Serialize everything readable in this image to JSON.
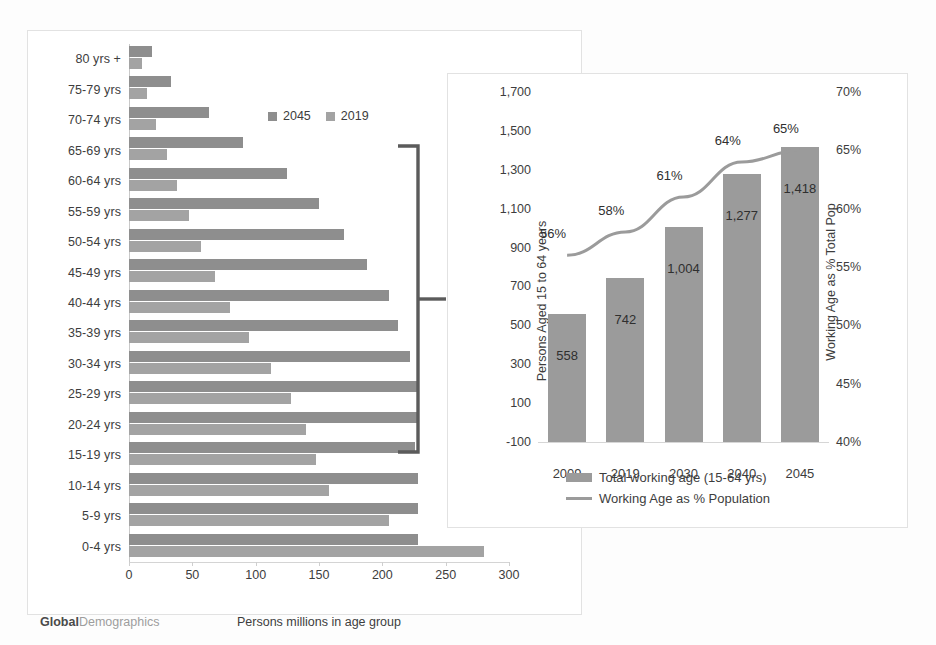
{
  "watermark": {
    "bold": "Global",
    "light": "Demographics"
  },
  "left_chart": {
    "x_axis_title": "Persons millions in age group",
    "x_ticks": [
      "0",
      "50",
      "100",
      "150",
      "200",
      "250",
      "300"
    ],
    "legend": [
      {
        "label": "2045",
        "color": "#8e8e8e"
      },
      {
        "label": "2019",
        "color": "#a3a3a3"
      }
    ]
  },
  "right_chart": {
    "y_left_title": "Persons Aged 15 to 64 years",
    "y_right_title": "Working Age as % Total Pop",
    "y_left_ticks": [
      "1,700",
      "1,500",
      "1,300",
      "1,100",
      "900",
      "700",
      "500",
      "300",
      "100",
      "-100"
    ],
    "y_right_ticks": [
      "70%",
      "65%",
      "60%",
      "55%",
      "50%",
      "45%",
      "40%"
    ],
    "legend": [
      {
        "label": "Total working age (15-64 yrs)",
        "type": "bar",
        "color": "#9b9b9b"
      },
      {
        "label": "Working Age as % Population",
        "type": "line",
        "color": "#9b9b9b"
      }
    ]
  },
  "chart_data": [
    {
      "type": "bar",
      "orientation": "horizontal",
      "title": "",
      "xlabel": "Persons millions in age group",
      "ylabel": "",
      "xlim": [
        0,
        300
      ],
      "grid": false,
      "legend_position": "top-right",
      "categories": [
        "80 yrs +",
        "75-79 yrs",
        "70-74 yrs",
        "65-69 yrs",
        "60-64 yrs",
        "55-59 yrs",
        "50-54 yrs",
        "45-49 yrs",
        "40-44 yrs",
        "35-39 yrs",
        "30-34 yrs",
        "25-29 yrs",
        "20-24 yrs",
        "15-19 yrs",
        "10-14 yrs",
        "5-9 yrs",
        "0-4 yrs"
      ],
      "series": [
        {
          "name": "2045",
          "color": "#8e8e8e",
          "values": [
            18,
            33,
            63,
            90,
            125,
            150,
            170,
            188,
            205,
            212,
            222,
            228,
            228,
            226,
            228,
            228,
            228
          ]
        },
        {
          "name": "2019",
          "color": "#a3a3a3",
          "values": [
            10,
            14,
            21,
            30,
            38,
            47,
            57,
            68,
            80,
            95,
            112,
            128,
            140,
            148,
            158,
            205,
            280
          ]
        }
      ],
      "annotation": {
        "type": "bracket",
        "spans_categories": [
          "60-64 yrs",
          "15-19 yrs"
        ],
        "points_to": "right-chart"
      }
    },
    {
      "type": "combo",
      "title": "",
      "xlabel": "",
      "ylabel": "Persons Aged 15 to 64 years",
      "y2label": "Working Age as % Total Pop",
      "ylim": [
        -100,
        1700
      ],
      "y2lim": [
        40,
        70
      ],
      "grid": false,
      "legend_position": "bottom",
      "categories": [
        "2009",
        "2019",
        "2030",
        "2040",
        "2045"
      ],
      "series": [
        {
          "name": "Total working age (15-64 yrs)",
          "type": "bar",
          "color": "#9b9b9b",
          "axis": "left",
          "values": [
            558,
            742,
            1004,
            1277,
            1418
          ],
          "labels": [
            "558",
            "742",
            "1,004",
            "1,277",
            "1,418"
          ]
        },
        {
          "name": "Working Age as % Population",
          "type": "line",
          "color": "#9b9b9b",
          "axis": "right",
          "values": [
            56,
            58,
            61,
            64,
            65
          ],
          "labels": [
            "56%",
            "58%",
            "61%",
            "64%",
            "65%"
          ]
        }
      ]
    }
  ]
}
